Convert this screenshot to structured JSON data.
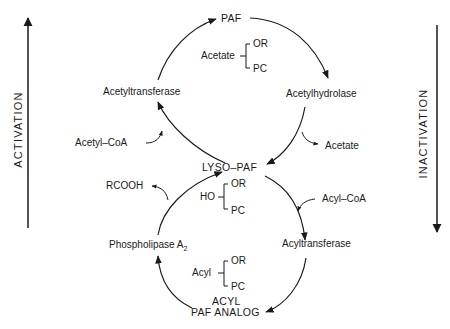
{
  "diagram": {
    "side_labels": {
      "left": "ACTIVATION",
      "right": "INACTIVATION"
    },
    "nodes": {
      "paf": "PAF",
      "acetyltransferase": "Acetyltransferase",
      "acetylhydrolase": "Acetylhydrolase",
      "lyso_paf": "LYSO–PAF",
      "phospholipase": "Phospholipase A",
      "phospholipase_sub": "2",
      "acyltransferase": "Acyltransferase",
      "acyl_paf_analog_line1": "ACYL",
      "acyl_paf_analog_line2": "PAF ANALOG"
    },
    "side_inputs": {
      "acetyl_coa": "Acetyl–CoA",
      "acetate_out": "Acetate",
      "rcooh": "RCOOH",
      "acyl_coa": "Acyl–CoA"
    },
    "structures": {
      "paf": {
        "group": "Acetate",
        "top": "OR",
        "bottom": "PC"
      },
      "lyso_paf": {
        "group": "HO",
        "top": "OR",
        "bottom": "PC"
      },
      "acyl_paf": {
        "group": "Acyl",
        "top": "OR",
        "bottom": "PC"
      }
    },
    "colors": {
      "line": "#1a1a1a",
      "background": "#ffffff"
    }
  }
}
